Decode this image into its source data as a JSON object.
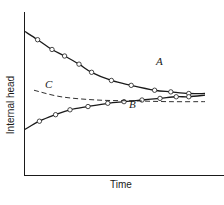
{
  "chart_data": {
    "type": "line",
    "title": "",
    "xlabel": "Time",
    "ylabel": "Internal head",
    "grid": false,
    "legend": "none (inline curve labels)",
    "axis_ticks": "none",
    "series": [
      {
        "name": "A",
        "style": "solid with open circle markers",
        "trend": "decreasing, asymptotic toward C from above",
        "x": [
          0,
          0.07,
          0.15,
          0.22,
          0.3,
          0.37,
          0.48,
          0.59,
          0.72,
          0.81,
          0.91,
          1.0
        ],
        "y": [
          0.88,
          0.83,
          0.77,
          0.73,
          0.68,
          0.63,
          0.58,
          0.55,
          0.52,
          0.51,
          0.5,
          0.5
        ],
        "markers": true
      },
      {
        "name": "B",
        "style": "solid with open circle markers",
        "trend": "increasing, asymptotic toward C from below",
        "x": [
          0,
          0.08,
          0.17,
          0.25,
          0.35,
          0.46,
          0.55,
          0.65,
          0.75,
          0.84,
          0.91,
          1.0
        ],
        "y": [
          0.28,
          0.33,
          0.37,
          0.4,
          0.42,
          0.44,
          0.45,
          0.46,
          0.47,
          0.48,
          0.48,
          0.49
        ],
        "markers": true
      },
      {
        "name": "C",
        "style": "dashed",
        "trend": "slightly decreasing, nearly constant equilibrium",
        "x": [
          0.05,
          0.2,
          0.4,
          0.6,
          0.8,
          1.0
        ],
        "y": [
          0.52,
          0.48,
          0.46,
          0.455,
          0.45,
          0.45
        ],
        "markers": false
      }
    ],
    "annotations": [
      "A",
      "B",
      "C"
    ],
    "colors": {
      "line": "#1a1a1a",
      "marker_fill": "#ffffff",
      "background": "#ffffff"
    }
  },
  "labels": {
    "ylabel": "Internal head",
    "xlabel": "Time",
    "curve_a": "A",
    "curve_b": "B",
    "curve_c": "C"
  }
}
